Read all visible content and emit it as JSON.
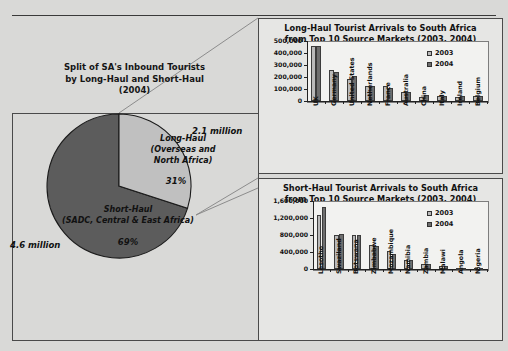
{
  "page": {
    "background_color": "#d9d9d7",
    "rule_color": "#3a3a3a"
  },
  "pie_panel": {
    "title_line1": "Split of SA's Inbound Tourists",
    "title_line2": "by Long-Haul and Short-Haul",
    "title_line3": "(2004)",
    "long_haul_label_line1": "Long-Haul",
    "long_haul_label_line2": "(Overseas and",
    "long_haul_label_line3": "North Africa)",
    "long_haul_pct": "31%",
    "long_haul_value": "2.1 million",
    "short_haul_label_line1": "Short-Haul",
    "short_haul_label_line2": "(SADC, Central & East Africa)",
    "short_haul_pct": "69%",
    "short_haul_value": "4.6 million"
  },
  "chart_data": [
    {
      "type": "bar",
      "id": "long-haul",
      "title": "Long-Haul Tourist Arrivals to South Africa\nfrom Top 10 Source Markets (2003, 2004)",
      "title_line1": "Long-Haul Tourist Arrivals to South Africa",
      "title_line2": "from Top 10 Source Markets (2003, 2004)",
      "xlabel": "",
      "ylabel": "",
      "ylim": [
        0,
        500000
      ],
      "yticks": [
        0,
        100000,
        200000,
        300000,
        400000,
        500000
      ],
      "ytick_labels": [
        "0",
        "100,000",
        "200,000",
        "300,000",
        "400,000",
        "500,000"
      ],
      "grid": false,
      "legend_position": "top-right",
      "categories": [
        "UK",
        "Germany",
        "United States",
        "Netherlands",
        "France",
        "Australia",
        "China",
        "Italy",
        "Ireland",
        "Belgium"
      ],
      "series": [
        {
          "name": "2003",
          "color": "#b9b9b9",
          "values": [
            455000,
            257000,
            186000,
            122000,
            128000,
            71000,
            36000,
            41000,
            32000,
            39000
          ]
        },
        {
          "name": "2004",
          "color": "#6e6e6e",
          "values": [
            460000,
            240000,
            207000,
            123000,
            111000,
            76000,
            46000,
            41000,
            38000,
            40000
          ]
        }
      ]
    },
    {
      "type": "bar",
      "id": "short-haul",
      "title": "Short-Haul Tourist Arrivals to South Africa\nfrom Top 10 Source Markets (2003, 2004)",
      "title_line1": "Short-Haul Tourist Arrivals to South Africa",
      "title_line2": "from Top 10 Source Markets (2003, 2004)",
      "xlabel": "",
      "ylabel": "",
      "ylim": [
        0,
        1600000
      ],
      "yticks": [
        0,
        400000,
        800000,
        1200000,
        1600000
      ],
      "ytick_labels": [
        "0",
        "400,000",
        "800,000",
        "1,200,000",
        "1,600,000"
      ],
      "grid": false,
      "legend_position": "top-right",
      "categories": [
        "Lesotho",
        "Swaziland",
        "Botswana",
        "Zimbabwe",
        "Mozambique",
        "Namibia",
        "Zambia",
        "Malawi",
        "Angola",
        "Nigeria"
      ],
      "series": [
        {
          "name": "2003",
          "color": "#b9b9b9",
          "values": [
            1270000,
            800000,
            800000,
            560000,
            420000,
            210000,
            120000,
            70000,
            12000,
            10000
          ]
        },
        {
          "name": "2004",
          "color": "#6e6e6e",
          "values": [
            1470000,
            830000,
            805000,
            535000,
            350000,
            210000,
            118000,
            70000,
            11000,
            9000
          ]
        }
      ]
    }
  ],
  "pie_data": {
    "type": "pie",
    "slices": [
      {
        "label": "Long-Haul (Overseas and North Africa)",
        "value": 31,
        "color": "#c0c0c0"
      },
      {
        "label": "Short-Haul (SADC, Central & East Africa)",
        "value": 69,
        "color": "#5c5c5c"
      }
    ]
  }
}
